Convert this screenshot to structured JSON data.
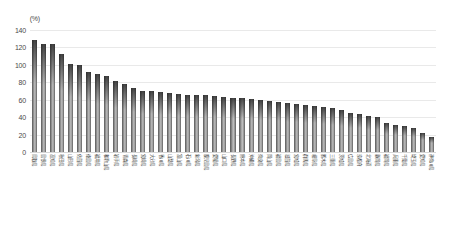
{
  "chart_data": {
    "type": "bar",
    "title": "",
    "subtitle": "",
    "xlabel": "",
    "ylabel": "",
    "unit_label": "(%)",
    "ylim": [
      0,
      140
    ],
    "ytick_step": 20,
    "yticks": [
      "140",
      "120",
      "100",
      "80",
      "60",
      "40",
      "20",
      "0"
    ],
    "grid": true,
    "legend": false,
    "legend_position": "none",
    "bar_color": "#8a8a8a",
    "grid_color": "#e9e9e9",
    "axis_text_color": "#4a4a4a",
    "background_color": "#ffffff",
    "categories": [
      "鳥取県",
      "島根県",
      "高知県",
      "秋田県",
      "山形県",
      "佐賀県",
      "徳島県",
      "福井県",
      "和歌山県",
      "岩手県",
      "青森県",
      "長崎県",
      "宮崎県",
      "大分県",
      "香川県",
      "山梨県",
      "富山県",
      "石川県",
      "新潟県",
      "鹿児島県",
      "愛媛県",
      "山口県",
      "長野県",
      "熊本県",
      "沖縄県",
      "奈良県",
      "岡山県",
      "福島県",
      "滋賀県",
      "宮城県",
      "群馬県",
      "岐阜県",
      "栃木県",
      "三重県",
      "茨城県",
      "広島県",
      "京都府",
      "北海道",
      "静岡県",
      "福岡県",
      "兵庫県",
      "千葉県",
      "埼玉県",
      "愛知県",
      "神奈川県"
    ],
    "values": [
      128,
      124,
      124,
      113,
      101,
      100,
      92,
      89,
      87,
      81,
      78,
      74,
      70,
      70,
      69,
      68,
      67,
      66,
      65,
      65,
      64,
      63,
      62,
      62,
      61,
      60,
      59,
      57,
      56,
      55,
      54,
      53,
      52,
      50,
      48,
      45,
      44,
      41,
      40,
      33,
      31,
      30,
      28,
      22,
      17
    ]
  }
}
